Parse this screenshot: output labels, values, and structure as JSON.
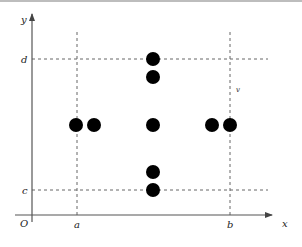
{
  "diagram": {
    "axes": {
      "x_label": "x",
      "y_label": "y",
      "origin_label": "O"
    },
    "x_ticks": [
      {
        "label": "a",
        "x": 77
      },
      {
        "label": "b",
        "x": 230
      }
    ],
    "y_ticks": [
      {
        "label": "d",
        "y": 59
      },
      {
        "label": "c",
        "y": 190
      }
    ],
    "region_label": "v",
    "points": [
      {
        "x": 153,
        "y": 59
      },
      {
        "x": 153,
        "y": 77
      },
      {
        "x": 153,
        "y": 125
      },
      {
        "x": 153,
        "y": 172
      },
      {
        "x": 153,
        "y": 190
      },
      {
        "x": 76,
        "y": 125
      },
      {
        "x": 94,
        "y": 125
      },
      {
        "x": 212,
        "y": 125
      },
      {
        "x": 230,
        "y": 125
      }
    ],
    "colors": {
      "axis": "#555555",
      "dashed": "#666666",
      "point": "#000000"
    }
  }
}
